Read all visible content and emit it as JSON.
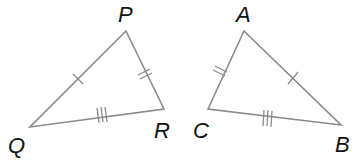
{
  "diagram": {
    "colors": {
      "edge": "#8a8a8a",
      "label": "#111111",
      "background": "#ffffff"
    },
    "triangles": [
      {
        "name": "PQR",
        "vertices": [
          {
            "label": "P",
            "x": 126,
            "y": 31,
            "lx": 118,
            "ly": 22
          },
          {
            "label": "Q",
            "x": 30,
            "y": 127,
            "lx": 8,
            "ly": 153
          },
          {
            "label": "R",
            "x": 164,
            "y": 109,
            "lx": 154,
            "ly": 138
          }
        ],
        "sides": [
          {
            "name": "PQ",
            "ticks": 1
          },
          {
            "name": "PR",
            "ticks": 2
          },
          {
            "name": "QR",
            "ticks": 3
          }
        ]
      },
      {
        "name": "ABC",
        "vertices": [
          {
            "label": "A",
            "x": 244,
            "y": 31,
            "lx": 236,
            "ly": 22
          },
          {
            "label": "C",
            "x": 208,
            "y": 109,
            "lx": 193,
            "ly": 138
          },
          {
            "label": "B",
            "x": 341,
            "y": 125,
            "lx": 335,
            "ly": 152
          }
        ],
        "sides": [
          {
            "name": "AB",
            "ticks": 1
          },
          {
            "name": "AC",
            "ticks": 2
          },
          {
            "name": "CB",
            "ticks": 3
          }
        ]
      }
    ]
  }
}
